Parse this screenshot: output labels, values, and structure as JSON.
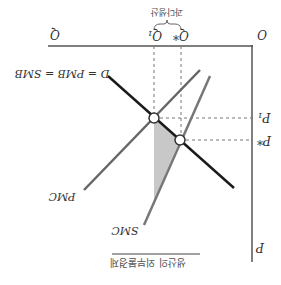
{
  "diagram": {
    "title": "생산의 외부불경제",
    "orientation": "rotated-180",
    "axes": {
      "origin_label": "O",
      "x_label": "Q",
      "y_label": "P"
    },
    "price_ticks": [
      {
        "label": "P₁",
        "meaning": "price at market equilibrium"
      },
      {
        "label": "P*",
        "meaning": "socially optimal price"
      }
    ],
    "quantity_ticks": [
      {
        "label": "Q*",
        "meaning": "socially optimal quantity"
      },
      {
        "label": "Q₁",
        "meaning": "market equilibrium quantity"
      }
    ],
    "brace_label": "과다생산",
    "curves": [
      {
        "id": "demand",
        "label": "D = PMB = SMB",
        "color": "#1a1a1a"
      },
      {
        "id": "pmc",
        "label": "PMC",
        "color": "#666666"
      },
      {
        "id": "smc",
        "label": "SMC",
        "color": "#777777"
      }
    ],
    "shaded_region": {
      "meaning": "deadweight loss",
      "color": "#c8c8c8"
    },
    "equilibria": [
      {
        "name": "market equilibrium",
        "on": [
          "demand",
          "pmc"
        ],
        "price": "P₁",
        "quantity": "Q₁"
      },
      {
        "name": "social optimum",
        "on": [
          "demand",
          "smc"
        ],
        "price": "P*",
        "quantity": "Q*"
      }
    ]
  }
}
